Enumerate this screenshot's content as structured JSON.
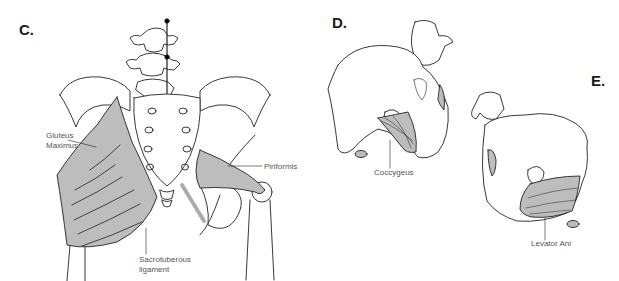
{
  "figure": {
    "panels": [
      {
        "letter": "C.",
        "description": "Posterior view of pelvis",
        "labels": {
          "gluteus_maximus": "Gluteus\nMaximus",
          "gluteus_line1": "Gluteus",
          "gluteus_line2": "Maximus",
          "piriformis": "Piriformis",
          "sacrotuberous_line1": "Sacrotuberous",
          "sacrotuberous_line2": "ligament"
        }
      },
      {
        "letter": "D.",
        "description": "Oblique view of pelvis",
        "labels": {
          "coccygeus": "Coccygeus"
        }
      },
      {
        "letter": "E.",
        "description": "Oblique view of pelvis",
        "labels": {
          "levator_ani": "Levator Ani"
        }
      }
    ],
    "colors": {
      "line": "#222222",
      "muscle_fill": "#bdbdbd",
      "label_text": "#555555",
      "background": "#ffffff"
    }
  }
}
